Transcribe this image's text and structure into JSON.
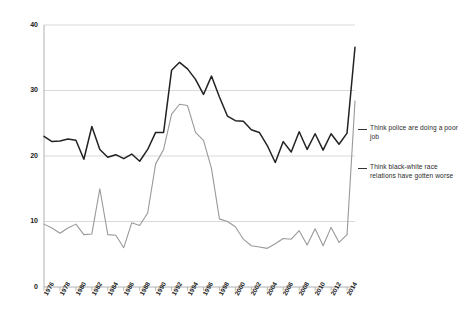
{
  "chart_data": {
    "type": "line",
    "title": "",
    "subtitle": "",
    "xlabel": "",
    "ylabel": "",
    "xlim": [
      1976,
      2015
    ],
    "ylim": [
      0,
      40
    ],
    "grid": true,
    "legend_position": "right",
    "yticks": [
      0,
      10,
      20,
      30,
      40
    ],
    "xticks": [
      1976,
      1978,
      1980,
      1982,
      1984,
      1986,
      1988,
      1990,
      1992,
      1994,
      1996,
      1998,
      2000,
      2002,
      2004,
      2006,
      2008,
      2010,
      2012,
      2014
    ],
    "x": [
      1976,
      1977,
      1978,
      1979,
      1980,
      1981,
      1982,
      1983,
      1984,
      1985,
      1986,
      1987,
      1988,
      1989,
      1990,
      1991,
      1992,
      1993,
      1994,
      1995,
      1996,
      1997,
      1998,
      1999,
      2000,
      2001,
      2002,
      2003,
      2004,
      2005,
      2006,
      2007,
      2008,
      2009,
      2010,
      2011,
      2012,
      2013,
      2014,
      2015
    ],
    "series": [
      {
        "name": "Think police are doing a poor job",
        "color": "#222222",
        "values": [
          23.0,
          22.2,
          22.3,
          22.6,
          22.4,
          19.5,
          24.5,
          21.0,
          19.8,
          20.2,
          19.6,
          20.3,
          19.2,
          21.0,
          23.6,
          23.6,
          33.1,
          34.3,
          33.3,
          31.7,
          29.4,
          32.2,
          29.0,
          26.1,
          25.4,
          25.3,
          24.0,
          23.6,
          21.6,
          19.0,
          22.2,
          20.6,
          23.7,
          21.0,
          23.4,
          20.9,
          23.4,
          21.8,
          23.5,
          36.6
        ]
      },
      {
        "name": "Think black-white race relations have gotten worse",
        "color": "#999999",
        "values": [
          9.6,
          9.0,
          8.2,
          9.0,
          9.6,
          8.0,
          8.1,
          15.0,
          8.0,
          7.9,
          6.0,
          9.8,
          9.4,
          11.3,
          18.8,
          21.0,
          26.4,
          27.9,
          27.7,
          23.6,
          22.4,
          18.1,
          10.4,
          10.0,
          9.2,
          7.3,
          6.3,
          6.1,
          5.9,
          6.6,
          7.4,
          7.3,
          8.6,
          6.4,
          8.9,
          6.3,
          9.1,
          6.8,
          8.0,
          28.4
        ]
      }
    ]
  },
  "legend": {
    "entries": [
      {
        "label": "Think police are doing a poor job"
      },
      {
        "label": "Think black-white race relations have gotten worse"
      }
    ]
  }
}
